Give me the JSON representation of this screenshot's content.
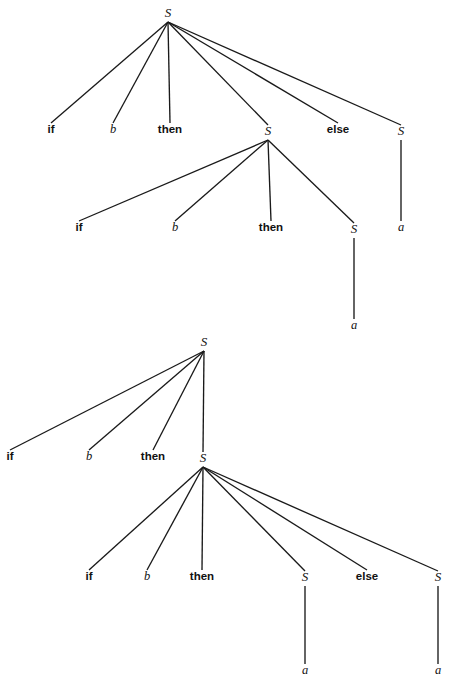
{
  "figure": {
    "title": "",
    "background_color": "#ffffff",
    "line_color": "#1a1a1a",
    "text_color": "#111111",
    "width": 449,
    "height": 690
  },
  "trees": [
    {
      "id": "tree-1",
      "description": "Parse tree one: right-branching nested if-then inside the then-branch",
      "nodes": [
        {
          "id": "t1-root",
          "label": "S",
          "kind": "nonterminal",
          "x": 168,
          "y": 17
        },
        {
          "id": "t1-if",
          "label": "if",
          "kind": "terminal-bold",
          "x": 51,
          "y": 133
        },
        {
          "id": "t1-b",
          "label": "b",
          "kind": "terminal-italic",
          "x": 113,
          "y": 133
        },
        {
          "id": "t1-then",
          "label": "then",
          "kind": "terminal-bold",
          "x": 170,
          "y": 133
        },
        {
          "id": "t1-inner",
          "label": "S",
          "kind": "nonterminal",
          "x": 268,
          "y": 135
        },
        {
          "id": "t1-else",
          "label": "else",
          "kind": "terminal-bold",
          "x": 338,
          "y": 133
        },
        {
          "id": "t1-rightS",
          "label": "S",
          "kind": "nonterminal",
          "x": 401,
          "y": 135
        },
        {
          "id": "t1-right-a",
          "label": "a",
          "kind": "terminal-italic",
          "x": 401,
          "y": 231
        },
        {
          "id": "t1-if2",
          "label": "if",
          "kind": "terminal-bold",
          "x": 79,
          "y": 231
        },
        {
          "id": "t1-b2",
          "label": "b",
          "kind": "terminal-italic",
          "x": 175,
          "y": 231
        },
        {
          "id": "t1-then2",
          "label": "then",
          "kind": "terminal-bold",
          "x": 271,
          "y": 231
        },
        {
          "id": "t1-innerS",
          "label": "S",
          "kind": "nonterminal",
          "x": 354,
          "y": 233
        },
        {
          "id": "t1-inner-a",
          "label": "a",
          "kind": "terminal-italic",
          "x": 354,
          "y": 329
        }
      ],
      "edges": [
        {
          "from": "t1-root",
          "to": "t1-if"
        },
        {
          "from": "t1-root",
          "to": "t1-b"
        },
        {
          "from": "t1-root",
          "to": "t1-then"
        },
        {
          "from": "t1-root",
          "to": "t1-inner"
        },
        {
          "from": "t1-root",
          "to": "t1-else"
        },
        {
          "from": "t1-root",
          "to": "t1-rightS"
        },
        {
          "from": "t1-rightS",
          "to": "t1-right-a"
        },
        {
          "from": "t1-inner",
          "to": "t1-if2"
        },
        {
          "from": "t1-inner",
          "to": "t1-b2"
        },
        {
          "from": "t1-inner",
          "to": "t1-then2"
        },
        {
          "from": "t1-inner",
          "to": "t1-innerS"
        },
        {
          "from": "t1-innerS",
          "to": "t1-inner-a"
        }
      ]
    },
    {
      "id": "tree-2",
      "description": "Parse tree two: the else-branch attaches to the inner nested if-then-else",
      "nodes": [
        {
          "id": "t2-root",
          "label": "S",
          "kind": "nonterminal",
          "x": 204,
          "y": 346
        },
        {
          "id": "t2-if",
          "label": "if",
          "kind": "terminal-bold",
          "x": 10,
          "y": 460
        },
        {
          "id": "t2-b",
          "label": "b",
          "kind": "terminal-italic",
          "x": 89,
          "y": 460
        },
        {
          "id": "t2-then",
          "label": "then",
          "kind": "terminal-bold",
          "x": 153,
          "y": 460
        },
        {
          "id": "t2-inner",
          "label": "S",
          "kind": "nonterminal",
          "x": 203,
          "y": 462
        },
        {
          "id": "t2-if2",
          "label": "if",
          "kind": "terminal-bold",
          "x": 89,
          "y": 580
        },
        {
          "id": "t2-b2",
          "label": "b",
          "kind": "terminal-italic",
          "x": 147,
          "y": 580
        },
        {
          "id": "t2-then2",
          "label": "then",
          "kind": "terminal-bold",
          "x": 202,
          "y": 580
        },
        {
          "id": "t2-S3",
          "label": "S",
          "kind": "nonterminal",
          "x": 305,
          "y": 581
        },
        {
          "id": "t2-else",
          "label": "else",
          "kind": "terminal-bold",
          "x": 367,
          "y": 580
        },
        {
          "id": "t2-S4",
          "label": "S",
          "kind": "nonterminal",
          "x": 438,
          "y": 581
        },
        {
          "id": "t2-a1",
          "label": "a",
          "kind": "terminal-italic",
          "x": 305,
          "y": 674
        },
        {
          "id": "t2-a2",
          "label": "a",
          "kind": "terminal-italic",
          "x": 438,
          "y": 674
        }
      ],
      "edges": [
        {
          "from": "t2-root",
          "to": "t2-if"
        },
        {
          "from": "t2-root",
          "to": "t2-b"
        },
        {
          "from": "t2-root",
          "to": "t2-then"
        },
        {
          "from": "t2-root",
          "to": "t2-inner"
        },
        {
          "from": "t2-inner",
          "to": "t2-if2"
        },
        {
          "from": "t2-inner",
          "to": "t2-b2"
        },
        {
          "from": "t2-inner",
          "to": "t2-then2"
        },
        {
          "from": "t2-inner",
          "to": "t2-S3"
        },
        {
          "from": "t2-inner",
          "to": "t2-else"
        },
        {
          "from": "t2-inner",
          "to": "t2-S4"
        },
        {
          "from": "t2-S3",
          "to": "t2-a1"
        },
        {
          "from": "t2-S4",
          "to": "t2-a2"
        }
      ]
    }
  ]
}
